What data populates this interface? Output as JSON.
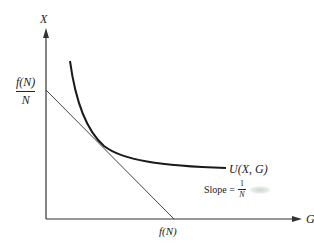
{
  "diagram": {
    "axes": {
      "y_label": "X",
      "x_label": "G"
    },
    "intercepts": {
      "y_intercept": {
        "numerator": "f(N)",
        "denominator": "N"
      },
      "x_intercept": "f(N)"
    },
    "curve_label": "U(X, G)",
    "slope_annotation": {
      "prefix": "Slope =",
      "numerator": "1",
      "denominator": "N"
    },
    "colors": {
      "ink": "#222222",
      "background": "#ffffff"
    }
  }
}
